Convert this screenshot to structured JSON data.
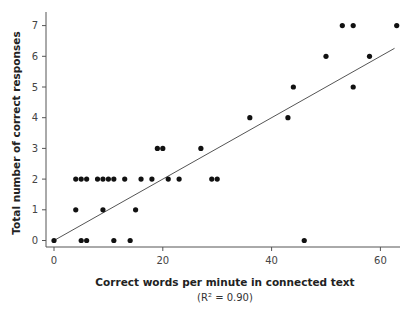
{
  "chart_data": {
    "type": "scatter",
    "title": "",
    "xlabel": "Correct words per minute in connected text",
    "xlabel_sub": "(R² = 0.90)",
    "ylabel": "Total number of correct responses",
    "xlim": [
      -1.5,
      63
    ],
    "ylim": [
      -0.2,
      7.4
    ],
    "xticks": [
      0,
      20,
      40,
      60
    ],
    "yticks": [
      0,
      1,
      2,
      3,
      4,
      5,
      6,
      7
    ],
    "grid": false,
    "legend": null,
    "r_squared": 0.9,
    "point_color": "#111111",
    "line_color": "#555555",
    "series": [
      {
        "name": "Students",
        "points": [
          {
            "x": 0,
            "y": 0
          },
          {
            "x": 5,
            "y": 0
          },
          {
            "x": 6,
            "y": 0
          },
          {
            "x": 11,
            "y": 0
          },
          {
            "x": 14,
            "y": 0
          },
          {
            "x": 46,
            "y": 0
          },
          {
            "x": 4,
            "y": 1
          },
          {
            "x": 9,
            "y": 1
          },
          {
            "x": 15,
            "y": 1
          },
          {
            "x": 4,
            "y": 2
          },
          {
            "x": 5,
            "y": 2
          },
          {
            "x": 6,
            "y": 2
          },
          {
            "x": 8,
            "y": 2
          },
          {
            "x": 9,
            "y": 2
          },
          {
            "x": 10,
            "y": 2
          },
          {
            "x": 11,
            "y": 2
          },
          {
            "x": 13,
            "y": 2
          },
          {
            "x": 16,
            "y": 2
          },
          {
            "x": 18,
            "y": 2
          },
          {
            "x": 21,
            "y": 2
          },
          {
            "x": 23,
            "y": 2
          },
          {
            "x": 29,
            "y": 2
          },
          {
            "x": 30,
            "y": 2
          },
          {
            "x": 19,
            "y": 3
          },
          {
            "x": 20,
            "y": 3
          },
          {
            "x": 27,
            "y": 3
          },
          {
            "x": 36,
            "y": 4
          },
          {
            "x": 43,
            "y": 4
          },
          {
            "x": 44,
            "y": 5
          },
          {
            "x": 55,
            "y": 5
          },
          {
            "x": 50,
            "y": 6
          },
          {
            "x": 58,
            "y": 6
          },
          {
            "x": 53,
            "y": 7
          },
          {
            "x": 55,
            "y": 7
          },
          {
            "x": 63,
            "y": 7
          }
        ]
      }
    ],
    "regression_line": {
      "x1": 0,
      "y1": 0,
      "x2": 62.6,
      "y2": 6.26
    }
  }
}
